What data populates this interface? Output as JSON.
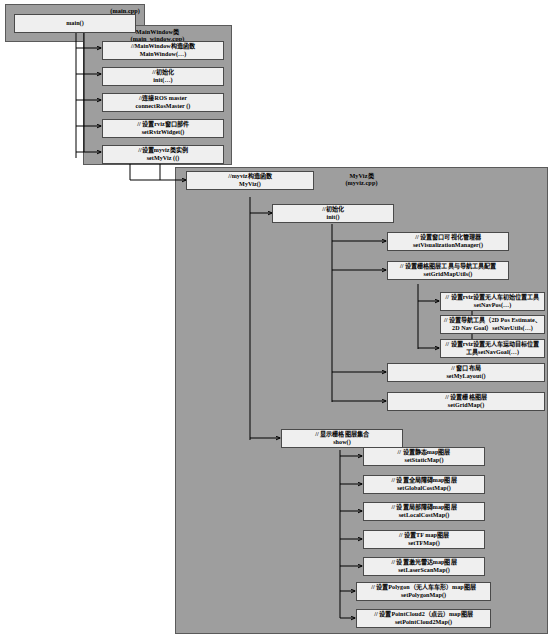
{
  "diagram": {
    "colors": {
      "container_fill": "#9e9e9e",
      "container_border": "#5a5a5a",
      "node_fill": "#efefef",
      "node_border": "#4a4a4a",
      "connector": "#000000",
      "page_background": "#ffffff"
    },
    "containers": [
      {
        "id": "main-cpp",
        "title": "(main.cpp)",
        "subtitle": ""
      },
      {
        "id": "mainwindow",
        "title": "MainWindow类",
        "subtitle": "(main_window.cpp)"
      },
      {
        "id": "myviz",
        "title": "MyViz类",
        "subtitle": "(myviz.cpp)"
      }
    ],
    "nodes": {
      "main_fn": {
        "line1": "main()",
        "line2": ""
      },
      "mw_ctor": {
        "line1": "//MainWindow构造函数",
        "line2": "MainWindow(…)"
      },
      "mw_init": {
        "line1": "//初始化",
        "line2": "init(…)"
      },
      "mw_ros": {
        "line1": "//连接ROS master",
        "line2": "connectRosMaster ()"
      },
      "mw_rviz_widget": {
        "line1": "// 设置rviz窗口部件",
        "line2": "setRvizWidget()"
      },
      "mw_setmyviz": {
        "line1": "//设置myviz类实例",
        "line2": "setMyViz (()"
      },
      "mv_ctor": {
        "line1": "//myviz构造函数",
        "line2": "MyViz()"
      },
      "mv_init": {
        "line1": "//初始化",
        "line2": "init()"
      },
      "mv_vismgr": {
        "line1": "// 设置窗口可视化管理器",
        "line2": "setVisualizationManager()"
      },
      "mv_gridutils": {
        "line1": "// 设置栅格图层工具与导航工具配置",
        "line2": "setGridMapUtils()"
      },
      "mv_navpos": {
        "line1": "// 设置rviz设置无人车初始位置工具",
        "line2": "setNavPos(…)"
      },
      "mv_navutils": {
        "line1": "// 设置导航工具（2D Pos Estimate、",
        "line2": "2D Nav Goal）setNavUtils(…)"
      },
      "mv_navgoal": {
        "line1": "// 设置rviz设置无人车运动目标位置",
        "line2": "工具setNavGoal(…)"
      },
      "mv_layout": {
        "line1": "// 窗口布局",
        "line2": "setMyLayout()"
      },
      "mv_gridmap": {
        "line1": "// 设置栅格图层",
        "line2": "setGridMap()"
      },
      "mv_show": {
        "line1": "// 显示栅格图层集合",
        "line2": "show()"
      },
      "mv_static": {
        "line1": "// 设置静态map图层",
        "line2": "setStaticMap()"
      },
      "mv_globalcost": {
        "line1": "// 设置全局障碍map图层",
        "line2": "setGlobalCostMap()"
      },
      "mv_localcost": {
        "line1": "// 设置局部障碍map图层",
        "line2": "setLocalCostMap()"
      },
      "mv_tf": {
        "line1": "// 设置TF map图层",
        "line2": "setTFMap()"
      },
      "mv_laser": {
        "line1": "// 设置激光雷达map图层",
        "line2": "setLaserScanMap()"
      },
      "mv_polygon": {
        "line1": "// 设置Polygon（无人车车形）map图层",
        "line2": "setPolygonMap()"
      },
      "mv_pointcloud": {
        "line1": "// 设置PointCloud2（点云）map图层",
        "line2": "setPointCloud2Map()"
      }
    }
  }
}
